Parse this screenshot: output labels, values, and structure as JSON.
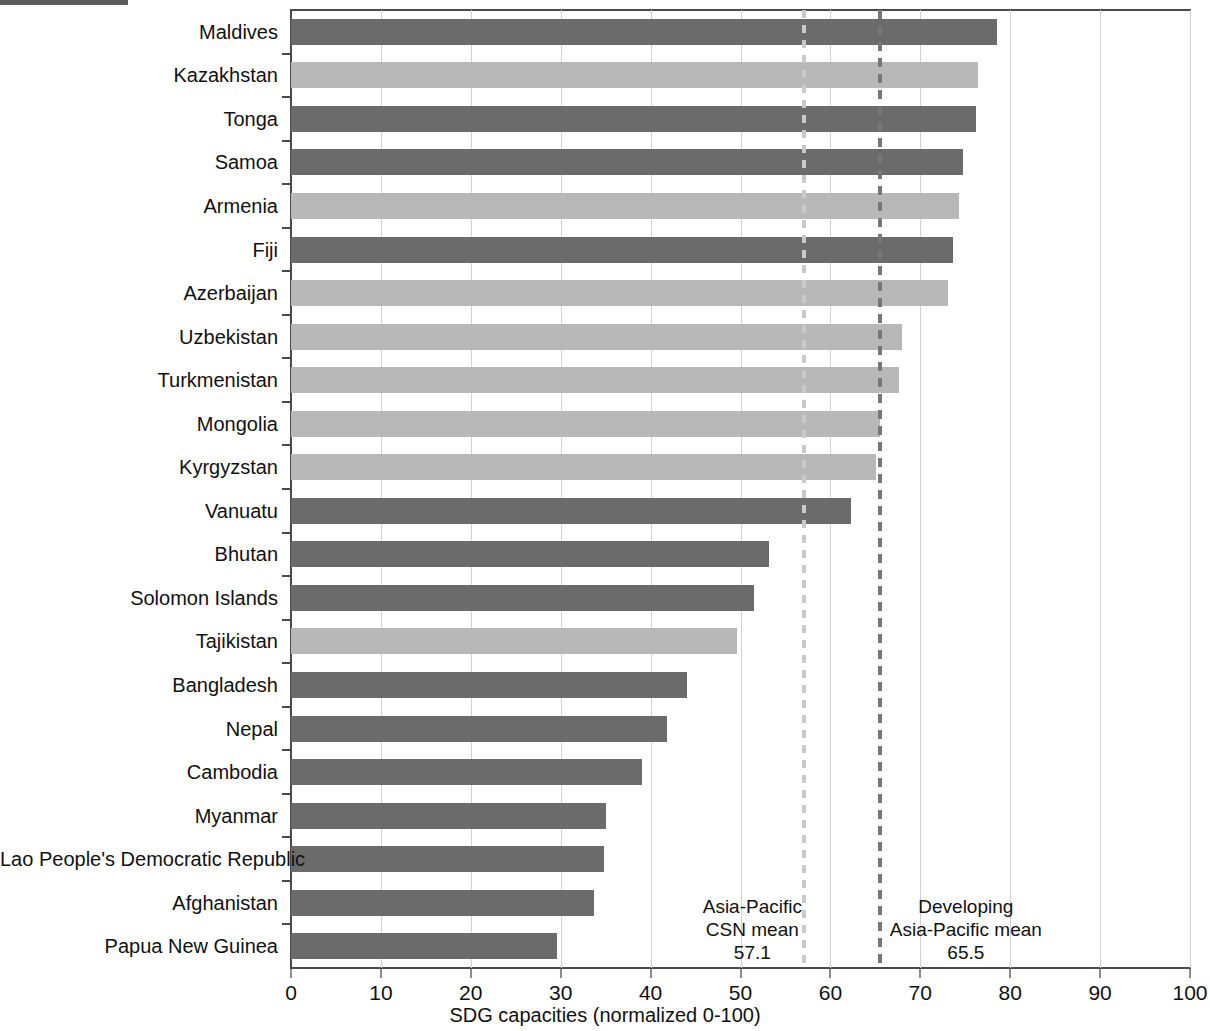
{
  "figure": {
    "xaxis_title": "SDG capacities (normalized 0-100)"
  },
  "chart_data": {
    "type": "bar",
    "orientation": "horizontal",
    "title": "",
    "xlabel": "SDG capacities (normalized 0-100)",
    "ylabel": "",
    "xlim": [
      0,
      100
    ],
    "xticks": [
      "0",
      "10",
      "20",
      "30",
      "40",
      "50",
      "60",
      "70",
      "80",
      "90",
      "100"
    ],
    "grid": "vertical",
    "legend": "none",
    "categories": [
      "Maldives",
      "Kazakhstan",
      "Tonga",
      "Samoa",
      "Armenia",
      "Fiji",
      "Azerbaijan",
      "Uzbekistan",
      "Turkmenistan",
      "Mongolia",
      "Kyrgyzstan",
      "Vanuatu",
      "Bhutan",
      "Solomon Islands",
      "Tajikistan",
      "Bangladesh",
      "Nepal",
      "Cambodia",
      "Myanmar",
      "Lao People's Democratic Republic",
      "Afghanistan",
      "Papua New Guinea"
    ],
    "values": [
      78.5,
      76.4,
      76.2,
      74.8,
      74.3,
      73.6,
      73.1,
      68.0,
      67.6,
      65.5,
      65.1,
      62.3,
      53.2,
      51.5,
      49.6,
      44.0,
      41.8,
      39.0,
      35.0,
      34.8,
      33.7,
      29.6
    ],
    "bar_colors": [
      "dark",
      "light",
      "dark",
      "dark",
      "light",
      "dark",
      "light",
      "light",
      "light",
      "light",
      "light",
      "dark",
      "dark",
      "dark",
      "light",
      "dark",
      "dark",
      "dark",
      "dark",
      "dark",
      "dark",
      "dark"
    ],
    "colors": {
      "dark": "#6b6b6b",
      "light": "#b8b8b8",
      "grid": "#d2d2d2",
      "axis": "#4a4a4a",
      "refline_light": "#c9c9c9",
      "refline_dark": "#777777"
    },
    "reference_lines": [
      {
        "name": "asia-pacific-csn-mean",
        "value": 57.1,
        "value_label": "57.1",
        "label_line1": "Asia-Pacific",
        "label_line2": "CSN mean",
        "style": "light"
      },
      {
        "name": "developing-asia-pacific-mean",
        "value": 65.5,
        "value_label": "65.5",
        "label_line1": "Developing",
        "label_line2": "Asia-Pacific mean",
        "style": "dark"
      }
    ]
  }
}
